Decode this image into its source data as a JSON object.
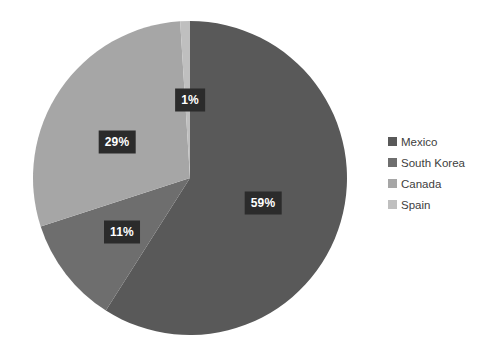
{
  "chart_data": {
    "type": "pie",
    "title": "",
    "categories": [
      "Mexico",
      "South Korea",
      "Canada",
      "Spain"
    ],
    "values": [
      59,
      11,
      29,
      1
    ],
    "value_labels": [
      "59%",
      "11%",
      "29%",
      "1%"
    ],
    "colors": [
      "#595959",
      "#6e6e6e",
      "#a6a6a6",
      "#bfbfbf"
    ],
    "unit": "%",
    "start_angle_deg": 0,
    "direction": "clockwise",
    "legend": {
      "position": "right",
      "entries": [
        {
          "label": "Mexico",
          "color": "#595959"
        },
        {
          "label": "South Korea",
          "color": "#6e6e6e"
        },
        {
          "label": "Canada",
          "color": "#a6a6a6"
        },
        {
          "label": "Spain",
          "color": "#bfbfbf"
        }
      ]
    },
    "data_labels": [
      {
        "label": "1%",
        "x": 190,
        "y": 100,
        "series": "Spain"
      },
      {
        "label": "29%",
        "x": 117,
        "y": 142,
        "series": "Canada"
      },
      {
        "label": "59%",
        "x": 263,
        "y": 203,
        "series": "Mexico"
      },
      {
        "label": "11%",
        "x": 122,
        "y": 232,
        "series": "South Korea"
      }
    ],
    "geometry": {
      "center_x": 190,
      "center_y": 178,
      "radius": 157
    },
    "background_color": "#ffffff",
    "label_text_color": "#ffffff",
    "label_box_color": "#2b2b2b"
  }
}
